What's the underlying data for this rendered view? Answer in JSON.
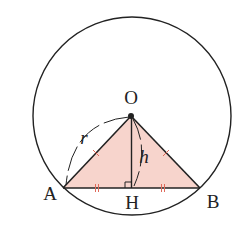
{
  "diagram": {
    "type": "geometry",
    "points": {
      "O": {
        "label": "O"
      },
      "A": {
        "label": "A"
      },
      "B": {
        "label": "B"
      },
      "H": {
        "label": "H"
      }
    },
    "measures": {
      "radius": {
        "label": "r",
        "segment": "OA"
      },
      "height": {
        "label": "h",
        "segment": "OH"
      }
    },
    "markings": {
      "equal_sides": [
        "OA",
        "OB"
      ],
      "equal_halves": [
        "AH",
        "HB"
      ],
      "right_angle_at": "H"
    },
    "colors": {
      "stroke": "#222222",
      "triangle_fill": "#f7d4cc",
      "tick_marks": "#e06a5a"
    }
  }
}
